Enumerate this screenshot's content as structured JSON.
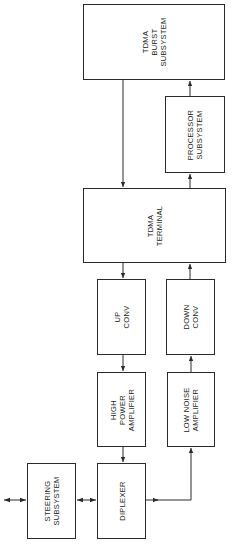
{
  "diagram": {
    "orientation": "rotated-90-ccw",
    "line_color": "#2a2a2a",
    "blocks": [
      {
        "id": "tdma_burst",
        "label": "TDMA\nBURST\nSUBSYSTEM",
        "x": 83,
        "y": 4,
        "w": 142,
        "h": 76
      },
      {
        "id": "processor",
        "label": "PROCESSOR\nSUBSYSTEM",
        "x": 165,
        "y": 96,
        "w": 60,
        "h": 77
      },
      {
        "id": "tdma_terminal",
        "label": "TDMA\nTERMINAL",
        "x": 83,
        "y": 188,
        "w": 143,
        "h": 75
      },
      {
        "id": "up_conv",
        "label": "UP\nCONV",
        "x": 97,
        "y": 279,
        "w": 49,
        "h": 76
      },
      {
        "id": "down_conv",
        "label": "DOWN\nCONV",
        "x": 166,
        "y": 279,
        "w": 49,
        "h": 76
      },
      {
        "id": "hpa",
        "label": "HIGH\nPOWER\nAMPLIFIER",
        "x": 97,
        "y": 372,
        "w": 49,
        "h": 75
      },
      {
        "id": "lna",
        "label": "LOW NOISE\nAMPLIFIER",
        "x": 167,
        "y": 372,
        "w": 48,
        "h": 75
      },
      {
        "id": "steering",
        "label": "STEERING\nSUBSYSTEM",
        "x": 27,
        "y": 463,
        "w": 49,
        "h": 76
      },
      {
        "id": "diplexer",
        "label": "DIPLEXER",
        "x": 97,
        "y": 463,
        "w": 49,
        "h": 76
      }
    ],
    "connections": [
      {
        "from": "tdma_burst",
        "to": "tdma_terminal"
      },
      {
        "from": "processor",
        "to": "tdma_burst"
      },
      {
        "from": "tdma_terminal",
        "to": "processor"
      },
      {
        "from": "tdma_terminal",
        "to": "up_conv"
      },
      {
        "from": "down_conv",
        "to": "tdma_terminal"
      },
      {
        "from": "up_conv",
        "to": "hpa"
      },
      {
        "from": "lna",
        "to": "down_conv"
      },
      {
        "from": "hpa",
        "to": "diplexer"
      },
      {
        "from": "diplexer",
        "to": "lna"
      },
      {
        "from": "diplexer",
        "to": "steering",
        "bidirectional": true
      },
      {
        "from": "steering",
        "to": "external",
        "bidirectional": true
      }
    ]
  }
}
